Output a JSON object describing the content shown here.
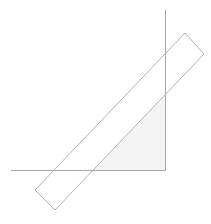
{
  "diagram": {
    "elements": [
      {
        "id": "vertical-line",
        "kind": "line"
      },
      {
        "id": "horizontal-line",
        "kind": "line"
      },
      {
        "id": "shaded-triangle",
        "kind": "polygon"
      },
      {
        "id": "tilted-rectangle",
        "kind": "polygon"
      }
    ],
    "colors": {
      "line": "#a8a8a8",
      "rectangle_stroke": "#b4b4b4",
      "triangle_fill": "#f4f4f4",
      "background": "#ffffff"
    }
  }
}
